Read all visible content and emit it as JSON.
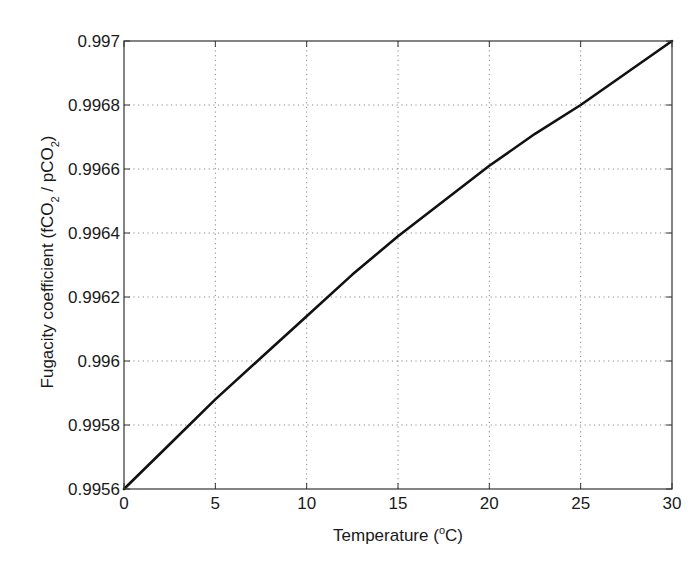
{
  "chart_data": {
    "type": "line",
    "title": "",
    "xlabel": "Temperature (°C)",
    "xlabel_parts": {
      "pre": "Temperature (",
      "sup": "o",
      "post": "C)"
    },
    "ylabel": "Fugacity coefficient (fCO2 / pCO2)",
    "ylabel_parts": {
      "a": "Fugacity coefficient (fCO",
      "sub1": "2",
      "b": " / pCO",
      "sub2": "2",
      "c": ")"
    },
    "xlim": [
      0,
      30
    ],
    "ylim": [
      0.9956,
      0.997
    ],
    "grid": true,
    "grid_style": "dotted",
    "xticks": [
      0,
      5,
      10,
      15,
      20,
      25,
      30
    ],
    "xtick_labels": [
      "0",
      "5",
      "10",
      "15",
      "20",
      "25",
      "30"
    ],
    "yticks": [
      0.9956,
      0.9958,
      0.996,
      0.9962,
      0.9964,
      0.9966,
      0.9968,
      0.997
    ],
    "ytick_labels": [
      "0.9956",
      "0.9958",
      "0.996",
      "0.9962",
      "0.9964",
      "0.9966",
      "0.9968",
      "0.997"
    ],
    "series": [
      {
        "name": "Fugacity coefficient",
        "color": "#111111",
        "x": [
          0,
          2.5,
          5,
          7.5,
          10,
          12.5,
          15,
          17.5,
          20,
          22.5,
          25,
          27.5,
          30
        ],
        "values": [
          0.9956,
          0.99574,
          0.99588,
          0.99601,
          0.99614,
          0.99627,
          0.99639,
          0.9965,
          0.99661,
          0.99671,
          0.9968,
          0.9969,
          0.997
        ]
      }
    ],
    "legend": null
  },
  "colors": {
    "axis": "#333333",
    "grid": "#888888",
    "line": "#111111",
    "background": "#ffffff"
  }
}
